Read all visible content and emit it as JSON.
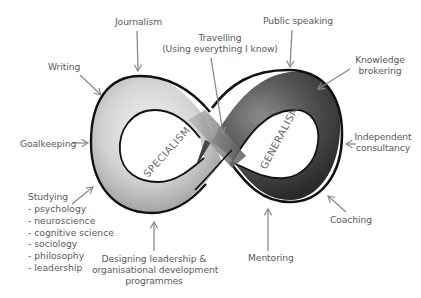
{
  "diagram": {
    "type": "infinity-loop",
    "loops": {
      "left": {
        "label": "SPECIALISM",
        "fill": "#c8c8c8"
      },
      "right": {
        "label": "GENERALISM",
        "fill": "#4a4a4a"
      }
    },
    "labels": {
      "journalism": "Journalism",
      "writing": "Writing",
      "travelling_line1": "Travelling",
      "travelling_line2": "(Using everything I know)",
      "public_speaking": "Public speaking",
      "knowledge_line1": "Knowledge",
      "knowledge_line2": "brokering",
      "goalkeeping": "Goalkeeping",
      "independent_line1": "Independent",
      "independent_line2": "consultancy",
      "studying_title": "Studying",
      "studying_items": [
        "- psychology",
        "- neuroscience",
        "- cognitive science",
        "- sociology",
        "- philosophy",
        "- leadership"
      ],
      "designing_line1": "Designing leadership &",
      "designing_line2": "organisational development",
      "designing_line3": "programmes",
      "mentoring": "Mentoring",
      "coaching": "Coaching"
    },
    "colors": {
      "outline": "#111111",
      "arrow": "#8a8a8a",
      "text": "#5a5a5a"
    }
  }
}
